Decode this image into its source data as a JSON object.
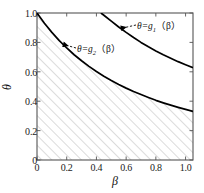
{
  "chart_data": {
    "type": "line",
    "title": "",
    "xlabel": "β",
    "ylabel": "θ",
    "xlim": [
      0,
      1.05
    ],
    "ylim": [
      0,
      1.0
    ],
    "grid": false,
    "legend_position": "inline-annotations",
    "xticks": [
      "0",
      "0.2",
      "0.4",
      "0.6",
      "0.8",
      "1.0"
    ],
    "xtick_values": [
      0,
      0.2,
      0.4,
      0.6,
      0.8,
      1.0
    ],
    "yticks": [
      "0",
      "0.2",
      "0.4",
      "0.6",
      "0.8",
      "1.0"
    ],
    "ytick_values": [
      0,
      0.2,
      0.4,
      0.6,
      0.8,
      1.0
    ],
    "series": [
      {
        "name": "θ=g₁(β)",
        "label_prefix": "θ=g",
        "label_sub": "1",
        "label_suffix": "(β)",
        "color": "#000000",
        "x": [
          0.43,
          0.45,
          0.5,
          0.55,
          0.6,
          0.65,
          0.7,
          0.75,
          0.8,
          0.85,
          0.9,
          0.95,
          1.0,
          1.05
        ],
        "values": [
          1.0,
          0.985,
          0.945,
          0.905,
          0.868,
          0.833,
          0.8,
          0.77,
          0.742,
          0.716,
          0.692,
          0.669,
          0.648,
          0.628
        ]
      },
      {
        "name": "θ=g₂(β)",
        "label_prefix": "θ=g",
        "label_sub": "2",
        "label_suffix": "(β)",
        "color": "#000000",
        "x": [
          0.0,
          0.05,
          0.1,
          0.15,
          0.2,
          0.25,
          0.3,
          0.35,
          0.4,
          0.45,
          0.5,
          0.55,
          0.6,
          0.65,
          0.7,
          0.75,
          0.8,
          0.85,
          0.9,
          0.95,
          1.0,
          1.05
        ],
        "values": [
          1.0,
          0.93,
          0.868,
          0.812,
          0.762,
          0.716,
          0.675,
          0.637,
          0.602,
          0.57,
          0.541,
          0.514,
          0.489,
          0.466,
          0.445,
          0.425,
          0.406,
          0.389,
          0.373,
          0.358,
          0.344,
          0.331
        ]
      }
    ],
    "shaded_region": {
      "name": "hatched-region-below-g2",
      "hatch": "diagonal-45",
      "hatch_color": "#b4b4b4",
      "bounded_by": "θ=g₂(β)"
    },
    "annotations": [
      {
        "name": "annotation-g1",
        "text": "θ=g₁(β)",
        "arrow": "left-arrow-dashed",
        "points_to_x": 0.565,
        "points_to_y": 0.895
      },
      {
        "name": "annotation-g2",
        "text": "θ=g₂(β)",
        "arrow": "left-arrow-dashed",
        "points_to_x": 0.175,
        "points_to_y": 0.787
      }
    ]
  },
  "axes": {
    "x_title": "β",
    "y_title": "θ",
    "x_tick_labels": [
      "0",
      "0.2",
      "0.4",
      "0.6",
      "0.8",
      "1.0"
    ],
    "y_tick_labels": [
      "0",
      "0.2",
      "0.4",
      "0.6",
      "0.8",
      "1.0"
    ]
  },
  "annotation_text": {
    "g1_prefix": "θ=g",
    "g1_sub": "1",
    "g1_suffix": "（β）",
    "g2_prefix": "θ=g",
    "g2_sub": "2",
    "g2_suffix": "（β）"
  },
  "colors": {
    "curve": "#000000",
    "frame": "#4d4d4d",
    "hatch": "#b4b4b4",
    "background": "#ffffff"
  }
}
